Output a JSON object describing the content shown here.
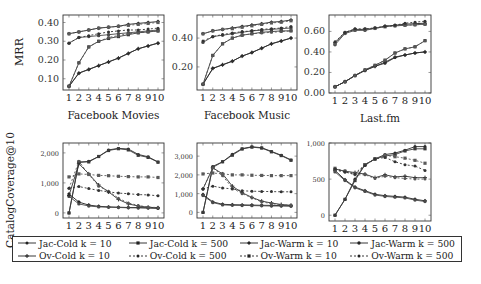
{
  "figure": {
    "row_ylabels": [
      "MRR",
      "CatalogCoverage@10"
    ]
  },
  "legend": {
    "items": [
      {
        "label": "Jac-Cold k = 10",
        "dash": "",
        "marker": "circle"
      },
      {
        "label": "Jac-Cold k = 500",
        "dash": "",
        "marker": "square"
      },
      {
        "label": "Jac-Warm k = 10",
        "dash": "",
        "marker": "diamond"
      },
      {
        "label": "Jac-Warm k = 500",
        "dash": "",
        "marker": "star"
      },
      {
        "label": "Ov-Cold k = 10",
        "dash": "",
        "marker": "plus"
      },
      {
        "label": "Ov-Cold k = 500",
        "dash": "2,2",
        "marker": "circle"
      },
      {
        "label": "Ov-Warm k = 10",
        "dash": "2,2",
        "marker": "square"
      },
      {
        "label": "Ov-Warm k = 500",
        "dash": "2,2",
        "marker": "circle"
      }
    ]
  },
  "chart_data": [
    {
      "type": "line",
      "title": "",
      "xlabel": "Facebook Movies",
      "ylabel": "MRR",
      "x": [
        1,
        2,
        3,
        4,
        5,
        6,
        7,
        8,
        9,
        10
      ],
      "yticks": [
        0.1,
        0.2,
        0.3,
        0.4
      ],
      "ytick_labels": [
        "0.10",
        "0.20",
        "0.30",
        "0.40"
      ],
      "ylim": [
        0.04,
        0.44
      ],
      "grid": false,
      "frame": {
        "x0": 63,
        "x1": 164,
        "y0": 15,
        "y1": 90
      },
      "series": [
        {
          "name": "Jac-Cold k = 10",
          "values": [
            0.06,
            0.13,
            0.15,
            0.17,
            0.19,
            0.21,
            0.235,
            0.26,
            0.275,
            0.29
          ]
        },
        {
          "name": "Jac-Cold k = 500",
          "values": [
            0.06,
            0.185,
            0.27,
            0.3,
            0.315,
            0.325,
            0.335,
            0.345,
            0.35,
            0.355
          ]
        },
        {
          "name": "Jac-Warm k = 10",
          "values": [
            0.34,
            0.35,
            0.36,
            0.37,
            0.375,
            0.38,
            0.39,
            0.395,
            0.4,
            0.405
          ]
        },
        {
          "name": "Jac-Warm k = 500",
          "values": [
            0.29,
            0.32,
            0.325,
            0.33,
            0.335,
            0.34,
            0.345,
            0.35,
            0.355,
            0.36
          ]
        },
        {
          "name": "Ov-Cold k = 10",
          "values": [
            0.06,
            0.13,
            0.15,
            0.17,
            0.19,
            0.21,
            0.235,
            0.26,
            0.275,
            0.29
          ]
        },
        {
          "name": "Ov-Cold k = 500",
          "values": [
            0.06,
            0.185,
            0.27,
            0.3,
            0.32,
            0.33,
            0.34,
            0.345,
            0.35,
            0.355
          ]
        },
        {
          "name": "Ov-Warm k = 10",
          "values": [
            0.34,
            0.35,
            0.36,
            0.37,
            0.375,
            0.38,
            0.385,
            0.39,
            0.395,
            0.4
          ]
        },
        {
          "name": "Ov-Warm k = 500",
          "values": [
            0.29,
            0.32,
            0.33,
            0.34,
            0.35,
            0.355,
            0.36,
            0.36,
            0.365,
            0.37
          ]
        }
      ]
    },
    {
      "type": "line",
      "title": "",
      "xlabel": "Facebook Music",
      "ylabel": "",
      "x": [
        1,
        2,
        3,
        4,
        5,
        6,
        7,
        8,
        9,
        10
      ],
      "yticks": [
        0.2,
        0.4
      ],
      "ytick_labels": [
        "0.20",
        "0.40"
      ],
      "ylim": [
        0.04,
        0.56
      ],
      "grid": false,
      "frame": {
        "x0": 197,
        "x1": 297,
        "y0": 15,
        "y1": 90
      },
      "series": [
        {
          "name": "Jac-Cold k = 10",
          "values": [
            0.08,
            0.19,
            0.215,
            0.24,
            0.275,
            0.3,
            0.33,
            0.36,
            0.38,
            0.4
          ]
        },
        {
          "name": "Jac-Cold k = 500",
          "values": [
            0.08,
            0.28,
            0.36,
            0.4,
            0.42,
            0.43,
            0.44,
            0.445,
            0.45,
            0.45
          ]
        },
        {
          "name": "Jac-Warm k = 10",
          "values": [
            0.43,
            0.45,
            0.46,
            0.47,
            0.48,
            0.49,
            0.5,
            0.51,
            0.515,
            0.525
          ]
        },
        {
          "name": "Jac-Warm k = 500",
          "values": [
            0.37,
            0.41,
            0.42,
            0.43,
            0.44,
            0.45,
            0.455,
            0.46,
            0.465,
            0.47
          ]
        },
        {
          "name": "Ov-Cold k = 10",
          "values": [
            0.08,
            0.19,
            0.215,
            0.24,
            0.275,
            0.3,
            0.33,
            0.36,
            0.38,
            0.4
          ]
        },
        {
          "name": "Ov-Cold k = 500",
          "values": [
            0.08,
            0.28,
            0.36,
            0.4,
            0.42,
            0.43,
            0.435,
            0.44,
            0.445,
            0.45
          ]
        },
        {
          "name": "Ov-Warm k = 10",
          "values": [
            0.43,
            0.45,
            0.46,
            0.465,
            0.475,
            0.485,
            0.495,
            0.505,
            0.51,
            0.52
          ]
        },
        {
          "name": "Ov-Warm k = 500",
          "values": [
            0.38,
            0.41,
            0.425,
            0.435,
            0.445,
            0.45,
            0.46,
            0.465,
            0.47,
            0.48
          ]
        }
      ]
    },
    {
      "type": "line",
      "title": "",
      "xlabel": "Last.fm",
      "ylabel": "",
      "x": [
        1,
        2,
        3,
        4,
        5,
        6,
        7,
        8,
        9,
        10
      ],
      "yticks": [
        0.0,
        0.2,
        0.4,
        0.6
      ],
      "ytick_labels": [
        "0.00",
        "0.20",
        "0.40",
        "0.60"
      ],
      "ylim": [
        0.0,
        0.76
      ],
      "grid": false,
      "frame": {
        "x0": 329,
        "x1": 431,
        "y0": 15,
        "y1": 93
      },
      "series": [
        {
          "name": "Jac-Cold k = 10",
          "values": [
            0.06,
            0.11,
            0.17,
            0.22,
            0.26,
            0.29,
            0.345,
            0.37,
            0.39,
            0.4
          ]
        },
        {
          "name": "Jac-Cold k = 500",
          "values": [
            0.06,
            0.11,
            0.17,
            0.225,
            0.27,
            0.32,
            0.39,
            0.43,
            0.45,
            0.51
          ]
        },
        {
          "name": "Jac-Warm k = 10",
          "values": [
            0.49,
            0.59,
            0.62,
            0.62,
            0.63,
            0.65,
            0.66,
            0.67,
            0.675,
            0.68
          ]
        },
        {
          "name": "Jac-Warm k = 500",
          "values": [
            0.47,
            0.58,
            0.61,
            0.61,
            0.63,
            0.65,
            0.655,
            0.66,
            0.665,
            0.67
          ]
        },
        {
          "name": "Ov-Cold k = 10",
          "values": [
            0.06,
            0.11,
            0.17,
            0.22,
            0.26,
            0.3,
            0.35,
            0.37,
            0.39,
            0.4
          ]
        },
        {
          "name": "Ov-Cold k = 500",
          "values": [
            0.06,
            0.11,
            0.17,
            0.225,
            0.27,
            0.32,
            0.39,
            0.43,
            0.45,
            0.51
          ]
        },
        {
          "name": "Ov-Warm k = 10",
          "values": [
            0.48,
            0.585,
            0.615,
            0.62,
            0.63,
            0.645,
            0.655,
            0.66,
            0.665,
            0.67
          ]
        },
        {
          "name": "Ov-Warm k = 500",
          "values": [
            0.5,
            0.59,
            0.625,
            0.625,
            0.635,
            0.65,
            0.66,
            0.68,
            0.69,
            0.7
          ]
        }
      ]
    },
    {
      "type": "line",
      "title": "",
      "xlabel": "",
      "ylabel": "CatalogCoverage@10",
      "x": [
        1,
        2,
        3,
        4,
        5,
        6,
        7,
        8,
        9,
        10
      ],
      "yticks": [
        0,
        1000,
        2000
      ],
      "ytick_labels": [
        "0",
        "1,000",
        "2,000"
      ],
      "ylim": [
        -170,
        2330
      ],
      "grid": false,
      "frame": {
        "x0": 63,
        "x1": 164,
        "y0": 143,
        "y1": 218
      },
      "series": [
        {
          "name": "Jac-Cold k = 10",
          "values": [
            0,
            1680,
            1720,
            1880,
            2100,
            2150,
            2130,
            1950,
            1870,
            1700
          ]
        },
        {
          "name": "Jac-Cold k = 500",
          "values": [
            0,
            1700,
            1700,
            1880,
            2080,
            2140,
            2100,
            1920,
            1850,
            1690
          ]
        },
        {
          "name": "Jac-Warm k = 10",
          "values": [
            630,
            360,
            260,
            220,
            200,
            190,
            180,
            180,
            170,
            160
          ]
        },
        {
          "name": "Jac-Warm k = 500",
          "values": [
            550,
            300,
            230,
            200,
            190,
            180,
            170,
            165,
            160,
            150
          ]
        },
        {
          "name": "Ov-Cold k = 10",
          "values": [
            580,
            1640,
            1300,
            930,
            700,
            450,
            300,
            230,
            190,
            170
          ]
        },
        {
          "name": "Ov-Cold k = 500",
          "values": [
            820,
            1720,
            1280,
            890,
            720,
            490,
            330,
            250,
            190,
            180
          ]
        },
        {
          "name": "Ov-Warm k = 10",
          "values": [
            1200,
            1300,
            1280,
            1250,
            1240,
            1220,
            1210,
            1200,
            1200,
            1180
          ]
        },
        {
          "name": "Ov-Warm k = 500",
          "values": [
            820,
            880,
            810,
            750,
            700,
            660,
            640,
            610,
            600,
            570
          ]
        }
      ]
    },
    {
      "type": "line",
      "title": "",
      "xlabel": "",
      "ylabel": "",
      "x": [
        1,
        2,
        3,
        4,
        5,
        6,
        7,
        8,
        9,
        10
      ],
      "yticks": [
        0,
        1000,
        2000,
        3000
      ],
      "ytick_labels": [
        "0",
        "1,000",
        "2,000",
        "3,000"
      ],
      "ylim": [
        -300,
        3700
      ],
      "grid": false,
      "frame": {
        "x0": 197,
        "x1": 297,
        "y0": 143,
        "y1": 218
      },
      "series": [
        {
          "name": "Jac-Cold k = 10",
          "values": [
            0,
            2450,
            2700,
            3100,
            3400,
            3500,
            3450,
            3250,
            3050,
            2800
          ]
        },
        {
          "name": "Jac-Cold k = 500",
          "values": [
            0,
            2400,
            2700,
            3050,
            3380,
            3480,
            3430,
            3230,
            3030,
            2780
          ]
        },
        {
          "name": "Jac-Warm k = 10",
          "values": [
            950,
            560,
            430,
            410,
            400,
            390,
            380,
            370,
            360,
            350
          ]
        },
        {
          "name": "Jac-Warm k = 500",
          "values": [
            900,
            520,
            400,
            380,
            370,
            360,
            350,
            340,
            340,
            330
          ]
        },
        {
          "name": "Ov-Cold k = 10",
          "values": [
            1250,
            2380,
            2050,
            1400,
            1050,
            800,
            600,
            500,
            420,
            380
          ]
        },
        {
          "name": "Ov-Cold k = 500",
          "values": [
            1250,
            2380,
            1950,
            1300,
            1000,
            780,
            560,
            470,
            400,
            380
          ]
        },
        {
          "name": "Ov-Warm k = 10",
          "values": [
            2050,
            2100,
            2050,
            2000,
            2000,
            1980,
            1970,
            1960,
            1960,
            1960
          ]
        },
        {
          "name": "Ov-Warm k = 500",
          "values": [
            1250,
            1400,
            1300,
            1250,
            1150,
            1130,
            1120,
            1110,
            1100,
            1100
          ]
        }
      ]
    },
    {
      "type": "line",
      "title": "",
      "xlabel": "",
      "ylabel": "",
      "x": [
        1,
        2,
        3,
        4,
        5,
        6,
        7,
        8,
        9,
        10
      ],
      "yticks": [
        0,
        500,
        1000
      ],
      "ytick_labels": [
        "0",
        "500",
        "1,000"
      ],
      "ylim": [
        -80,
        1000
      ],
      "grid": false,
      "frame": {
        "x0": 329,
        "x1": 431,
        "y0": 143,
        "y1": 221
      },
      "series": [
        {
          "name": "Jac-Cold k = 10",
          "values": [
            0,
            220,
            500,
            700,
            780,
            840,
            860,
            900,
            950,
            950
          ]
        },
        {
          "name": "Jac-Cold k = 500",
          "values": [
            0,
            220,
            480,
            700,
            780,
            820,
            840,
            890,
            920,
            920
          ]
        },
        {
          "name": "Jac-Warm k = 10",
          "values": [
            620,
            490,
            390,
            340,
            290,
            270,
            260,
            250,
            220,
            200
          ]
        },
        {
          "name": "Jac-Warm k = 500",
          "values": [
            600,
            480,
            380,
            330,
            280,
            260,
            250,
            240,
            210,
            190
          ]
        },
        {
          "name": "Ov-Cold k = 10",
          "values": [
            640,
            610,
            590,
            570,
            520,
            560,
            530,
            540,
            520,
            520
          ]
        },
        {
          "name": "Ov-Cold k = 500",
          "values": [
            620,
            600,
            560,
            560,
            510,
            540,
            520,
            510,
            500,
            500
          ]
        },
        {
          "name": "Ov-Warm k = 10",
          "values": [
            650,
            610,
            580,
            700,
            780,
            830,
            810,
            790,
            760,
            720
          ]
        },
        {
          "name": "Ov-Warm k = 500",
          "values": [
            640,
            600,
            570,
            690,
            780,
            800,
            740,
            700,
            680,
            620
          ]
        }
      ]
    }
  ]
}
